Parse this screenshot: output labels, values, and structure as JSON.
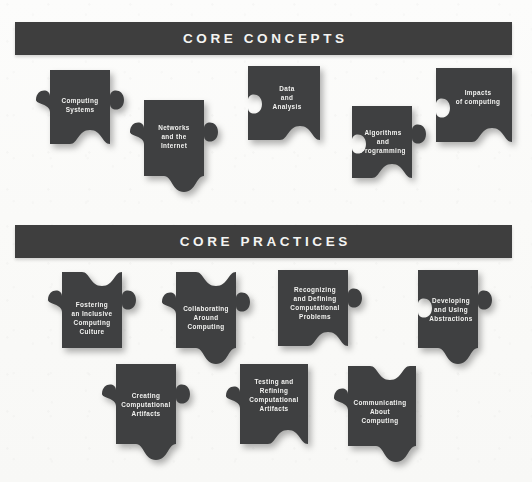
{
  "page": {
    "background_color": "#fbfbfa",
    "piece_color": "#3f4041",
    "banner_color": "#3e3e3e",
    "text_color": "#f2f2f0"
  },
  "sections": [
    {
      "id": "core-concepts",
      "banner_label": "CORE CONCEPTS",
      "pieces": [
        {
          "id": "computing-systems",
          "label": "Computing\nSystems"
        },
        {
          "id": "networks-and-internet",
          "label": "Networks\nand the\nInternet"
        },
        {
          "id": "data-and-analysis",
          "label": "Data\nand\nAnalysis"
        },
        {
          "id": "algorithms-programming",
          "label": "Algorithms\nand\nProgramming"
        },
        {
          "id": "impacts-of-computing",
          "label": "Impacts\nof computing"
        }
      ]
    },
    {
      "id": "core-practices",
      "banner_label": "CORE PRACTICES",
      "pieces": [
        {
          "id": "fostering-inclusive-culture",
          "label": "Fostering\nan Inclusive\nComputing\nCulture"
        },
        {
          "id": "collaborating-around-computing",
          "label": "Collaborating\nAround\nComputing"
        },
        {
          "id": "recognizing-defining-problems",
          "label": "Recognizing\nand Defining\nComputational\nProblems"
        },
        {
          "id": "developing-using-abstractions",
          "label": "Developing\nand Using\nAbstractions"
        },
        {
          "id": "creating-computational-artifacts",
          "label": "Creating\nComputational\nArtifacts"
        },
        {
          "id": "testing-refining-artifacts",
          "label": "Testing and\nRefining\nComputational\nArtifacts"
        },
        {
          "id": "communicating-about-computing",
          "label": "Communicating\nAbout\nComputing"
        }
      ]
    }
  ]
}
